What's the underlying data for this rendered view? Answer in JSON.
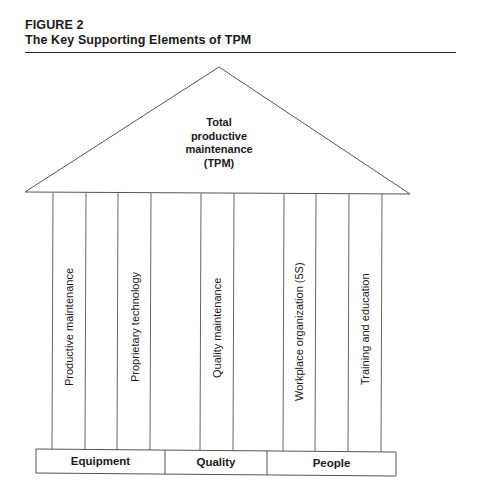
{
  "figure": {
    "label": "FIGURE 2",
    "title": "The Key Supporting Elements of TPM"
  },
  "roof": {
    "lines": [
      "Total",
      "productive",
      "maintenance",
      "(TPM)"
    ]
  },
  "pillars": [
    {
      "label": "Productive maintenance",
      "group": "Equipment"
    },
    {
      "label": "Proprietary technology",
      "group": "Equipment"
    },
    {
      "label": "Quality maintenance",
      "group": "Quality"
    },
    {
      "label": "Workplace organization (5S)",
      "group": "People"
    },
    {
      "label": "Training and education",
      "group": "People"
    }
  ],
  "foundation": {
    "segments": [
      "Equipment",
      "Quality",
      "People"
    ]
  },
  "colors": {
    "line": "#555555",
    "text": "#1a1a1a"
  }
}
